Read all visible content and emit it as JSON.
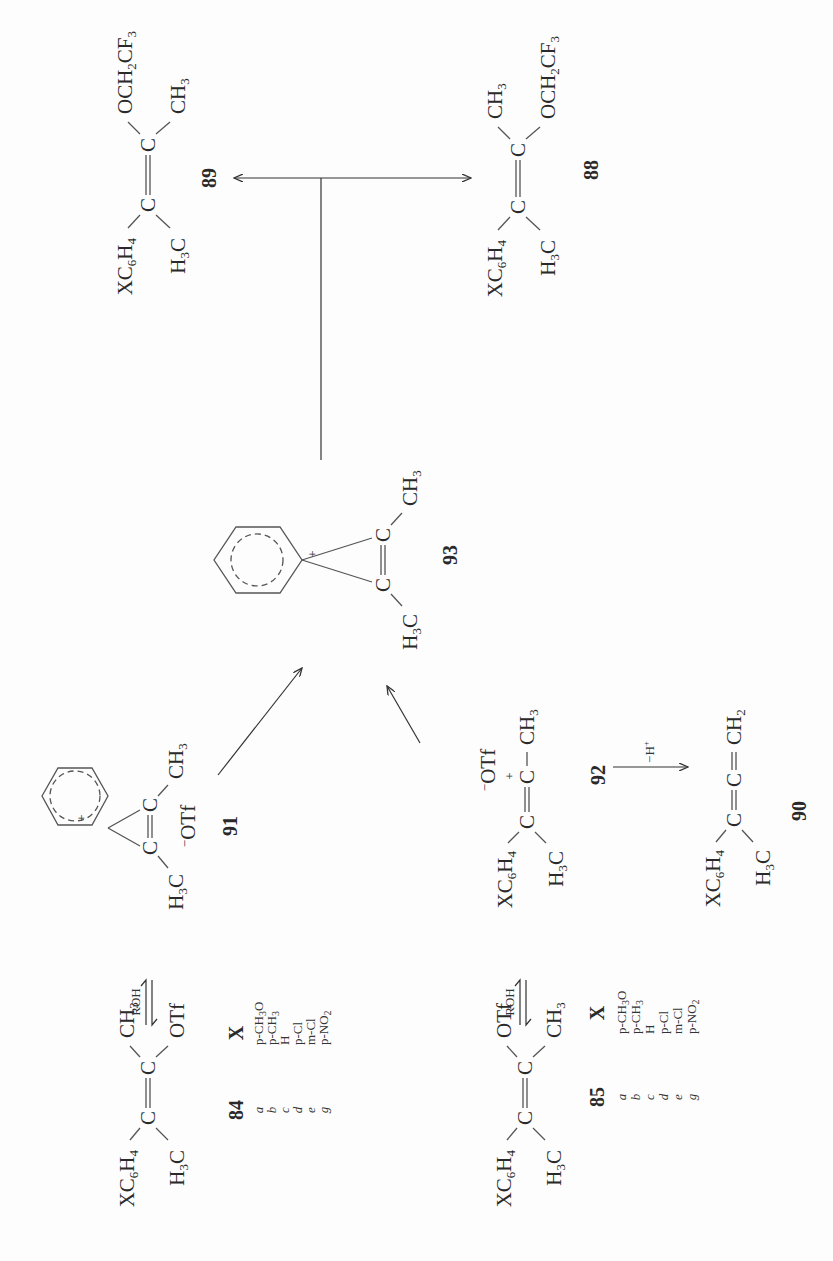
{
  "scheme": {
    "orientation": "rotated 90 degrees counterclockwise",
    "compounds": {
      "c84": {
        "number": "84",
        "left_top": "XC6H4",
        "left_bottom": "H3C",
        "right_top": "CH3",
        "right_bottom": "OTf"
      },
      "c85": {
        "number": "85",
        "left_top": "XC6H4",
        "left_bottom": "H3C",
        "right_top": "OTf",
        "right_bottom": "CH3"
      },
      "c91": {
        "number": "91",
        "left": "H3C",
        "right": "CH3",
        "counterion": "−OTf",
        "ring_charge": "+"
      },
      "c92": {
        "number": "92",
        "left_top": "XC6H4",
        "left_bottom": "H3C",
        "right": "CH3",
        "charge": "+",
        "counterion": "−OTf"
      },
      "c93": {
        "number": "93",
        "left": "H3C",
        "right": "CH3",
        "ring_charge": "+"
      },
      "c90": {
        "number": "90",
        "left_top": "XC6H4",
        "left_bottom": "H3C",
        "right": "CH2"
      },
      "c89": {
        "number": "89",
        "left_top": "XC6H4",
        "left_bottom": "H3C",
        "right_top": "OCH2CF3",
        "right_bottom": "CH3"
      },
      "c88": {
        "number": "88",
        "left_top": "XC6H4",
        "left_bottom": "H3C",
        "right_top": "CH3",
        "right_bottom": "OCH2CF3"
      }
    },
    "arrows": {
      "roh_84": "ROH",
      "roh_85": "ROH",
      "deprotonation": "−H+"
    },
    "substituent_table_84": {
      "header_compound": "84",
      "header_x": "X",
      "rows": [
        {
          "letter": "a",
          "x": "p-CH3O"
        },
        {
          "letter": "b",
          "x": "p-CH3"
        },
        {
          "letter": "c",
          "x": "H"
        },
        {
          "letter": "d",
          "x": "p-Cl"
        },
        {
          "letter": "e",
          "x": "m-Cl"
        },
        {
          "letter": "g",
          "x": "p-NO2"
        }
      ]
    },
    "substituent_table_85": {
      "header_compound": "85",
      "header_x": "X",
      "rows": [
        {
          "letter": "a",
          "x": "p-CH3O"
        },
        {
          "letter": "b",
          "x": "p-CH3"
        },
        {
          "letter": "c",
          "x": "H"
        },
        {
          "letter": "d",
          "x": "p-Cl"
        },
        {
          "letter": "e",
          "x": "m-Cl"
        },
        {
          "letter": "g",
          "x": "p-NO2"
        }
      ]
    }
  }
}
